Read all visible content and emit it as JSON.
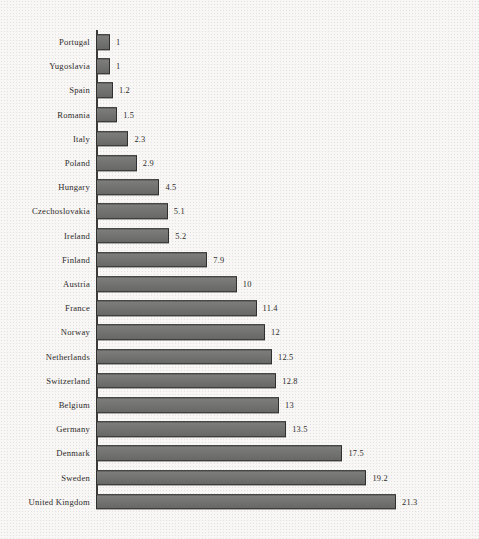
{
  "chart_data": {
    "type": "bar",
    "orientation": "horizontal",
    "title": "",
    "subtitle": "",
    "xlabel": "",
    "ylabel": "",
    "grid": false,
    "legend": null,
    "xlim": [
      0,
      21.3
    ],
    "axis_line": "left vertical baseline at zero",
    "value_labels": true,
    "sorted": "ascending by value (top to bottom)",
    "categories": [
      "Portugal",
      "Yugoslavia",
      "Spain",
      "Romania",
      "Italy",
      "Poland",
      "Hungary",
      "Czechoslovakia",
      "Ireland",
      "Finland",
      "Austria",
      "France",
      "Norway",
      "Netherlands",
      "Switzerland",
      "Belgium",
      "Germany",
      "Denmark",
      "Sweden",
      "United Kingdom"
    ],
    "values": [
      1,
      1,
      1.2,
      1.5,
      2.3,
      2.9,
      4.5,
      5.1,
      5.2,
      7.9,
      10,
      11.4,
      12,
      12.5,
      12.8,
      13,
      13.5,
      17.5,
      19.2,
      21.3
    ],
    "value_label_text": [
      "1",
      "1",
      "1.2",
      "1.5",
      "2.3",
      "2.9",
      "4.5",
      "5.1",
      "5.2",
      "7.9",
      "10",
      "11.4",
      "12",
      "12.5",
      "12.8",
      "13",
      "13.5",
      "17.5",
      "19.2",
      "21.3"
    ]
  },
  "style": {
    "bar_fill": "#6f6f6e",
    "bar_border": "#2f2f2f",
    "axis_color": "#3a3a3a",
    "text_color": "#2e2c2b",
    "background": "#f8f7f5"
  }
}
